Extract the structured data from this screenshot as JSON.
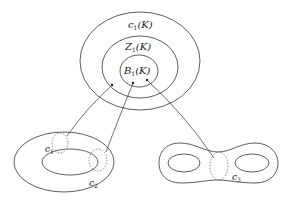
{
  "diagram": {
    "type": "set-inclusion-and-cycles",
    "sets": [
      {
        "id": "c1K",
        "label_main": "c",
        "label_sub": "1",
        "label_arg": "(K)",
        "role": "outer"
      },
      {
        "id": "Z1K",
        "label_main": "Z",
        "label_sub": "1",
        "label_arg": "(K)",
        "role": "middle"
      },
      {
        "id": "B1K",
        "label_main": "B",
        "label_sub": "1",
        "label_arg": "(K)",
        "role": "inner"
      }
    ],
    "surfaces": [
      {
        "id": "torus",
        "cycles": [
          {
            "label_main": "c",
            "label_sub": "1",
            "style": "dashed"
          },
          {
            "label_main": "c",
            "label_sub": "2",
            "style": "dashed"
          }
        ]
      },
      {
        "id": "double-torus",
        "cycles": [
          {
            "label_main": "c",
            "label_sub": "3",
            "style": "dashed"
          }
        ]
      }
    ],
    "arrows": [
      {
        "from": "c1",
        "to": "c1K-annulus-point"
      },
      {
        "from": "c2",
        "to": "B1K-point-left"
      },
      {
        "from": "c3",
        "to": "B1K-point-right"
      }
    ],
    "colors": {
      "stroke": "#333333",
      "dashed": "#555555",
      "background": "#ffffff"
    }
  },
  "caption": {
    "text": ""
  }
}
